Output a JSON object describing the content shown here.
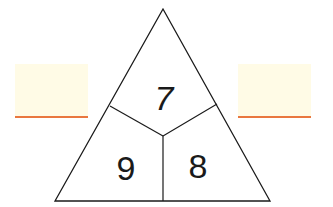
{
  "diagram": {
    "type": "number-triangle",
    "top_number": "7",
    "bottom_left_number": "9",
    "bottom_right_number": "8",
    "left_answer": "",
    "right_answer": ""
  },
  "colors": {
    "answer_box_fill": "#fffbe6",
    "answer_underline": "#e9773f",
    "line": "#1a1a1a"
  }
}
